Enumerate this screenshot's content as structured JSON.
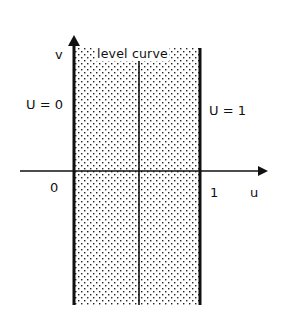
{
  "diagram": {
    "labels": {
      "v_axis": "v",
      "u_axis": "u",
      "level_curve": "level curve",
      "boundary_left": "U = 0",
      "boundary_right": "U = 1",
      "tick_zero": "0",
      "tick_one": "1"
    },
    "colors": {
      "line": "#111111",
      "dot": "#222222",
      "background": "#ffffff"
    },
    "geometry": {
      "strip_u_range": [
        0,
        1
      ],
      "level_curve_u": 0.5,
      "shaded": "dotted stipple between u=0 and u=1"
    }
  }
}
